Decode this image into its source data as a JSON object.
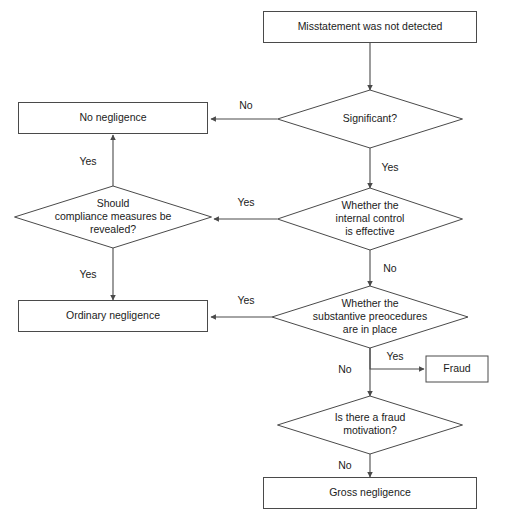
{
  "diagram": {
    "colors": {
      "stroke": "#4a4a4a",
      "text": "#1b1b1b",
      "background": "#ffffff"
    },
    "nodes": [
      {
        "id": "misstatement",
        "type": "process",
        "label": "Misstatement was not detected",
        "lines": [
          "Misstatement was not detected"
        ],
        "x": 370,
        "y": 27,
        "w": 213,
        "h": 31
      },
      {
        "id": "no-negligence",
        "type": "process",
        "label": "No negligence",
        "lines": [
          "No negligence"
        ],
        "x": 113,
        "y": 118,
        "w": 189,
        "h": 31
      },
      {
        "id": "significant",
        "type": "decision",
        "label": "Significant?",
        "lines": [
          "Significant?"
        ],
        "x": 370,
        "y": 119,
        "w": 185,
        "h": 58
      },
      {
        "id": "compliance",
        "type": "decision",
        "label": "Should compliance measures be revealed?",
        "lines": [
          "Should",
          "compliance measures be",
          "revealed?"
        ],
        "x": 113,
        "y": 217,
        "w": 197,
        "h": 62
      },
      {
        "id": "internal-control",
        "type": "decision",
        "label": "Whether the internal control is effective",
        "lines": [
          "Whether the",
          "internal control",
          "is effective"
        ],
        "x": 370,
        "y": 219,
        "w": 185,
        "h": 62
      },
      {
        "id": "ordinary-negligence",
        "type": "process",
        "label": "Ordinary negligence",
        "lines": [
          "Ordinary negligence"
        ],
        "x": 113,
        "y": 316,
        "w": 189,
        "h": 31
      },
      {
        "id": "substantive",
        "type": "decision",
        "label": "Whether the substantive preocedures are in place",
        "lines": [
          "Whether the",
          "substantive preocedures",
          "are in place"
        ],
        "x": 370,
        "y": 317,
        "w": 196,
        "h": 62
      },
      {
        "id": "fraud",
        "type": "process",
        "label": "Fraud",
        "lines": [
          "Fraud"
        ],
        "x": 457,
        "y": 369,
        "w": 62,
        "h": 26
      },
      {
        "id": "fraud-motivation",
        "type": "decision",
        "label": "Is there a fraud motivation?",
        "lines": [
          "Is there a fraud",
          "motivation?"
        ],
        "x": 370,
        "y": 425,
        "w": 185,
        "h": 58
      },
      {
        "id": "gross-negligence",
        "type": "process",
        "label": "Gross negligence",
        "lines": [
          "Gross negligence"
        ],
        "x": 370,
        "y": 493,
        "w": 213,
        "h": 31
      }
    ],
    "edges": [
      {
        "id": "e-misstatement-significant",
        "from": "misstatement",
        "to": "significant",
        "label": "",
        "points": "370,43 370,90",
        "label_x": 0,
        "label_y": 0
      },
      {
        "id": "e-significant-no",
        "from": "significant",
        "to": "no-negligence",
        "label": "No",
        "points": "277,119 211,119",
        "label_x": 246,
        "label_y": 106
      },
      {
        "id": "e-significant-yes",
        "from": "significant",
        "to": "internal-control",
        "label": "Yes",
        "points": "370,148 370,188",
        "label_x": 390,
        "label_y": 168
      },
      {
        "id": "e-control-yes",
        "from": "internal-control",
        "to": "compliance",
        "label": "Yes",
        "points": "277,219 214,219",
        "label_x": 246,
        "label_y": 203
      },
      {
        "id": "e-compliance-yes-up",
        "from": "compliance",
        "to": "no-negligence",
        "label": "Yes",
        "points": "113,186 113,135",
        "label_x": 88,
        "label_y": 162
      },
      {
        "id": "e-compliance-yes-down",
        "from": "compliance",
        "to": "ordinary-negligence",
        "label": "Yes",
        "points": "113,248 113,300",
        "label_x": 88,
        "label_y": 275
      },
      {
        "id": "e-control-no",
        "from": "internal-control",
        "to": "substantive",
        "label": "No",
        "points": "370,250 370,286",
        "label_x": 390,
        "label_y": 269
      },
      {
        "id": "e-substantive-yes-left",
        "from": "substantive",
        "to": "ordinary-negligence",
        "label": "Yes",
        "points": "272,317 211,317",
        "label_x": 246,
        "label_y": 301
      },
      {
        "id": "e-substantive-yes-fraud",
        "from": "substantive",
        "to": "fraud",
        "label": "Yes",
        "points": "370,348 370,369 424,369",
        "label_x": 395,
        "label_y": 357
      },
      {
        "id": "e-substantive-no",
        "from": "substantive",
        "to": "fraud-motivation",
        "label": "No",
        "points": "370,348 370,396",
        "label_x": 345,
        "label_y": 370
      },
      {
        "id": "e-motivation-no",
        "from": "fraud-motivation",
        "to": "gross-negligence",
        "label": "No",
        "points": "370,454 370,477",
        "label_x": 345,
        "label_y": 466
      }
    ],
    "caption": ""
  }
}
